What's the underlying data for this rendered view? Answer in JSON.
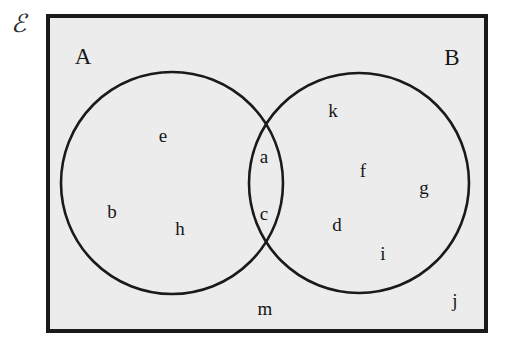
{
  "canvas": {
    "width": 516,
    "height": 346,
    "page_background": "#ffffff"
  },
  "universe": {
    "symbol": "ℰ",
    "name": "universal-set-symbol",
    "x": 18,
    "y": 23,
    "font_size": 25,
    "color": "#2a2a2a"
  },
  "rectangle": {
    "label": "universal-set-rectangle",
    "x": 46,
    "y": 14,
    "width": 442,
    "height": 319,
    "fill": "#ececec",
    "stroke": "#1a1a1a",
    "stroke_width": 4
  },
  "circles": [
    {
      "id": "A",
      "label": "A",
      "label_x": 83,
      "label_y": 56,
      "cx": 172,
      "cy": 183,
      "r": 111,
      "stroke": "#1a1a1a",
      "stroke_width": 2.6,
      "fill": "none"
    },
    {
      "id": "B",
      "label": "B",
      "label_x": 452,
      "label_y": 57,
      "cx": 359,
      "cy": 183,
      "r": 110,
      "stroke": "#1a1a1a",
      "stroke_width": 2.6,
      "fill": "none"
    }
  ],
  "label_font_size": 23,
  "element_font_size": 19,
  "elements": [
    {
      "text": "e",
      "x": 163,
      "y": 135,
      "region": "A-only"
    },
    {
      "text": "b",
      "x": 112,
      "y": 211,
      "region": "A-only"
    },
    {
      "text": "h",
      "x": 180,
      "y": 228,
      "region": "A-only"
    },
    {
      "text": "a",
      "x": 264,
      "y": 156,
      "region": "A-and-B"
    },
    {
      "text": "c",
      "x": 264,
      "y": 213,
      "region": "A-and-B"
    },
    {
      "text": "k",
      "x": 333,
      "y": 110,
      "region": "B-only"
    },
    {
      "text": "f",
      "x": 363,
      "y": 170,
      "region": "B-only"
    },
    {
      "text": "g",
      "x": 424,
      "y": 187,
      "region": "B-only"
    },
    {
      "text": "d",
      "x": 337,
      "y": 224,
      "region": "B-only"
    },
    {
      "text": "i",
      "x": 383,
      "y": 253,
      "region": "B-only"
    },
    {
      "text": "m",
      "x": 265,
      "y": 308,
      "region": "outside-circles"
    },
    {
      "text": "j",
      "x": 455,
      "y": 300,
      "region": "outside-circles"
    }
  ],
  "chart_data": {
    "type": "diagram",
    "diagram_type": "venn",
    "title": "",
    "sets": [
      "A",
      "B"
    ],
    "universe_symbol": "ℰ",
    "regions": {
      "A_only": [
        "e",
        "b",
        "h"
      ],
      "A_intersect_B": [
        "a",
        "c"
      ],
      "B_only": [
        "k",
        "f",
        "g",
        "d",
        "i"
      ],
      "outside_A_and_B": [
        "m",
        "j"
      ]
    },
    "counts": {
      "A_only": 3,
      "A_intersect_B": 2,
      "B_only": 5,
      "outside_A_and_B": 2,
      "universe_total": 12
    }
  }
}
